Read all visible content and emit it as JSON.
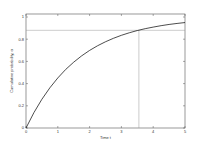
{
  "chart_data": {
    "type": "line",
    "title": "",
    "xlabel": "Time t",
    "ylabel": "Cumulative probability, α",
    "xlim": [
      0,
      5
    ],
    "ylim": [
      0,
      1.05
    ],
    "grid": false,
    "legend": null,
    "xticks": [
      0,
      1,
      2,
      3,
      4,
      5
    ],
    "xtick_labels": [
      "0",
      "1",
      "2",
      "3",
      "4",
      "5"
    ],
    "yticks": [
      0,
      0.2,
      0.4,
      0.6,
      0.8,
      1
    ],
    "ytick_labels": [
      "0",
      "0.2",
      "0.4",
      "0.6",
      "0.8",
      "1"
    ],
    "series": [
      {
        "name": "cumulative probability",
        "x": [
          0,
          0.25,
          0.5,
          0.75,
          1,
          1.25,
          1.5,
          1.75,
          2,
          2.25,
          2.5,
          2.75,
          3,
          3.25,
          3.5,
          3.75,
          4,
          4.25,
          4.5,
          4.75,
          5
        ],
        "y": [
          0,
          0.139,
          0.259,
          0.362,
          0.451,
          0.528,
          0.593,
          0.65,
          0.699,
          0.741,
          0.777,
          0.808,
          0.835,
          0.858,
          0.878,
          0.895,
          0.909,
          0.922,
          0.933,
          0.942,
          0.95
        ],
        "color": "#000000"
      }
    ],
    "annotations": [
      {
        "type": "hline",
        "y": 0.88,
        "x_from": 0,
        "x_to": 5,
        "color": "#888888"
      },
      {
        "type": "vline",
        "x": 3.55,
        "y_from": 0,
        "y_to": 0.88,
        "color": "#888888"
      }
    ]
  }
}
